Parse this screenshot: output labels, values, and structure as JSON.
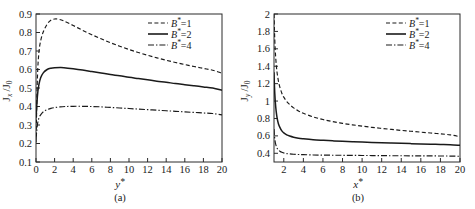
{
  "figure": {
    "panels": [
      {
        "id": "a",
        "caption": "(a)",
        "xlabel": "y*",
        "ylabel": "Jx/J0"
      },
      {
        "id": "b",
        "caption": "(b)",
        "xlabel": "x*",
        "ylabel": "Jy/J0"
      }
    ]
  },
  "chart_data": [
    {
      "type": "line",
      "panel": "a",
      "title": "",
      "xlabel": "y*",
      "ylabel": "Jx/J0",
      "xlim": [
        0,
        20
      ],
      "ylim": [
        0.1,
        0.9
      ],
      "xticks": [
        0,
        2,
        4,
        6,
        8,
        10,
        12,
        14,
        16,
        18,
        20
      ],
      "xticklabels": [
        "0",
        "2",
        "4",
        "6",
        "8",
        "10",
        "12",
        "14",
        "16",
        "18",
        "20"
      ],
      "yticks": [
        0.1,
        0.2,
        0.3,
        0.4,
        0.5,
        0.6,
        0.7,
        0.8,
        0.9
      ],
      "yticklabels": [
        "0.1",
        "0.2",
        "0.3",
        "0.4",
        "0.5",
        "0.6",
        "0.7",
        "0.8",
        "0.9"
      ],
      "grid": false,
      "legend_position": "top-right",
      "series": [
        {
          "name": "B*=1",
          "style": "dashed",
          "x": [
            0,
            0.15,
            0.3,
            0.5,
            0.8,
            1.2,
            1.6,
            2.0,
            2.4,
            3.0,
            4.0,
            5.0,
            6.0,
            7.0,
            8.0,
            9.0,
            10.0,
            11.0,
            12.0,
            13.0,
            14.0,
            15.0,
            16.0,
            17.0,
            18.0,
            19.0,
            20.0
          ],
          "y": [
            0.205,
            0.55,
            0.685,
            0.755,
            0.805,
            0.845,
            0.866,
            0.873,
            0.872,
            0.862,
            0.838,
            0.812,
            0.788,
            0.766,
            0.745,
            0.726,
            0.708,
            0.692,
            0.677,
            0.663,
            0.65,
            0.638,
            0.627,
            0.616,
            0.606,
            0.596,
            0.58
          ]
        },
        {
          "name": "B*=2",
          "style": "solid",
          "x": [
            0,
            0.15,
            0.3,
            0.5,
            0.8,
            1.2,
            1.6,
            2.0,
            2.6,
            3.0,
            4.0,
            5.0,
            6.0,
            7.0,
            8.0,
            9.0,
            10.0,
            11.0,
            12.0,
            13.0,
            14.0,
            15.0,
            16.0,
            17.0,
            18.0,
            19.0,
            20.0
          ],
          "y": [
            0.335,
            0.455,
            0.515,
            0.555,
            0.583,
            0.6,
            0.607,
            0.61,
            0.611,
            0.61,
            0.604,
            0.597,
            0.589,
            0.581,
            0.573,
            0.566,
            0.558,
            0.551,
            0.544,
            0.537,
            0.531,
            0.524,
            0.518,
            0.512,
            0.506,
            0.5,
            0.488
          ]
        },
        {
          "name": "B*=4",
          "style": "dashdot",
          "x": [
            0,
            0.15,
            0.3,
            0.5,
            0.8,
            1.2,
            1.6,
            2.0,
            2.6,
            3.2,
            4.0,
            5.0,
            6.0,
            7.0,
            8.0,
            9.0,
            10.0,
            11.0,
            12.0,
            13.0,
            14.0,
            15.0,
            16.0,
            17.0,
            18.0,
            19.0,
            20.0
          ],
          "y": [
            0.225,
            0.3,
            0.335,
            0.355,
            0.372,
            0.383,
            0.39,
            0.394,
            0.398,
            0.4,
            0.401,
            0.401,
            0.4,
            0.398,
            0.395,
            0.392,
            0.389,
            0.386,
            0.383,
            0.38,
            0.377,
            0.374,
            0.371,
            0.368,
            0.365,
            0.362,
            0.355
          ]
        }
      ]
    },
    {
      "type": "line",
      "panel": "b",
      "title": "",
      "xlabel": "x*",
      "ylabel": "Jy/J0",
      "xlim": [
        1,
        20
      ],
      "ylim": [
        0.3,
        2.0
      ],
      "xticks": [
        2,
        4,
        6,
        8,
        10,
        12,
        14,
        16,
        18,
        20
      ],
      "xticklabels": [
        "2",
        "4",
        "6",
        "8",
        "10",
        "12",
        "14",
        "16",
        "18",
        "20"
      ],
      "yticks": [
        0.4,
        0.6,
        0.8,
        1.0,
        1.2,
        1.4,
        1.6,
        1.8,
        2.0
      ],
      "yticklabels": [
        "0.4",
        "0.6",
        "0.8",
        "1",
        "1.2",
        "1.4",
        "1.6",
        "1.8",
        "2"
      ],
      "grid": false,
      "legend_position": "top-right",
      "series": [
        {
          "name": "B*=1",
          "style": "dashed",
          "x": [
            1.0,
            1.05,
            1.12,
            1.2,
            1.3,
            1.45,
            1.6,
            1.8,
            2.0,
            2.3,
            2.6,
            3.0,
            3.5,
            4.0,
            5.0,
            6.0,
            7.0,
            8.0,
            9.0,
            10.0,
            11.0,
            12.0,
            13.0,
            14.0,
            15.0,
            16.0,
            17.0,
            18.0,
            19.0,
            20.0
          ],
          "y": [
            2.0,
            1.8,
            1.6,
            1.46,
            1.34,
            1.23,
            1.16,
            1.09,
            1.045,
            0.995,
            0.96,
            0.922,
            0.886,
            0.86,
            0.818,
            0.788,
            0.764,
            0.744,
            0.727,
            0.712,
            0.698,
            0.686,
            0.674,
            0.663,
            0.653,
            0.643,
            0.633,
            0.624,
            0.612,
            0.59
          ]
        },
        {
          "name": "B*=2",
          "style": "solid",
          "x": [
            1.0,
            1.03,
            1.08,
            1.14,
            1.22,
            1.32,
            1.45,
            1.6,
            1.8,
            2.0,
            2.3,
            2.6,
            3.0,
            3.5,
            4.0,
            5.0,
            6.0,
            7.0,
            8.0,
            9.0,
            10.0,
            11.0,
            12.0,
            13.0,
            14.0,
            15.0,
            16.0,
            17.0,
            18.0,
            19.0,
            20.0
          ],
          "y": [
            1.33,
            1.22,
            1.09,
            0.98,
            0.885,
            0.805,
            0.74,
            0.697,
            0.657,
            0.634,
            0.612,
            0.598,
            0.585,
            0.574,
            0.567,
            0.556,
            0.549,
            0.543,
            0.538,
            0.533,
            0.529,
            0.525,
            0.521,
            0.518,
            0.514,
            0.511,
            0.508,
            0.505,
            0.502,
            0.499,
            0.492
          ]
        },
        {
          "name": "B*=4",
          "style": "dashdot",
          "x": [
            1.0,
            1.03,
            1.08,
            1.14,
            1.22,
            1.32,
            1.45,
            1.6,
            1.8,
            2.0,
            2.3,
            2.6,
            3.0,
            3.5,
            4.0,
            5.0,
            6.0,
            7.0,
            8.0,
            9.0,
            10.0,
            11.0,
            12.0,
            13.0,
            14.0,
            15.0,
            16.0,
            17.0,
            18.0,
            19.0,
            20.0
          ],
          "y": [
            0.68,
            0.625,
            0.565,
            0.52,
            0.485,
            0.458,
            0.438,
            0.424,
            0.411,
            0.404,
            0.397,
            0.393,
            0.389,
            0.386,
            0.384,
            0.381,
            0.379,
            0.378,
            0.377,
            0.376,
            0.375,
            0.374,
            0.373,
            0.372,
            0.372,
            0.371,
            0.37,
            0.37,
            0.369,
            0.368,
            0.366
          ]
        }
      ]
    }
  ],
  "legend": {
    "entries": [
      {
        "label": "B*=1",
        "style": "dashed"
      },
      {
        "label": "B*=2",
        "style": "solid"
      },
      {
        "label": "B*=4",
        "style": "dashdot"
      }
    ]
  }
}
